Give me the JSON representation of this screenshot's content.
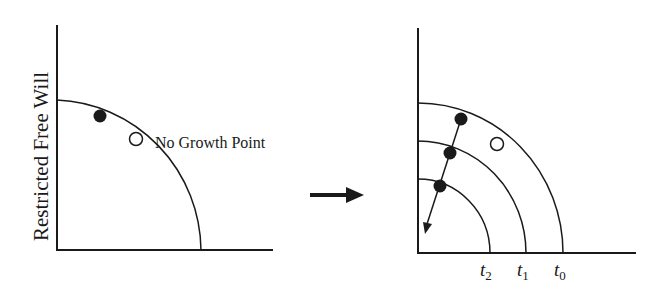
{
  "left_panel": {
    "ylabel": "Restricted Free Will",
    "annotation": "No Growth Point"
  },
  "transition": {
    "icon": "right-arrow-icon"
  },
  "right_panel": {
    "curve_labels": [
      {
        "base": "t",
        "sub": "2"
      },
      {
        "base": "t",
        "sub": "1"
      },
      {
        "base": "t",
        "sub": "0"
      }
    ]
  },
  "colors": {
    "ink": "#1a1a1a",
    "background": "#ffffff"
  }
}
